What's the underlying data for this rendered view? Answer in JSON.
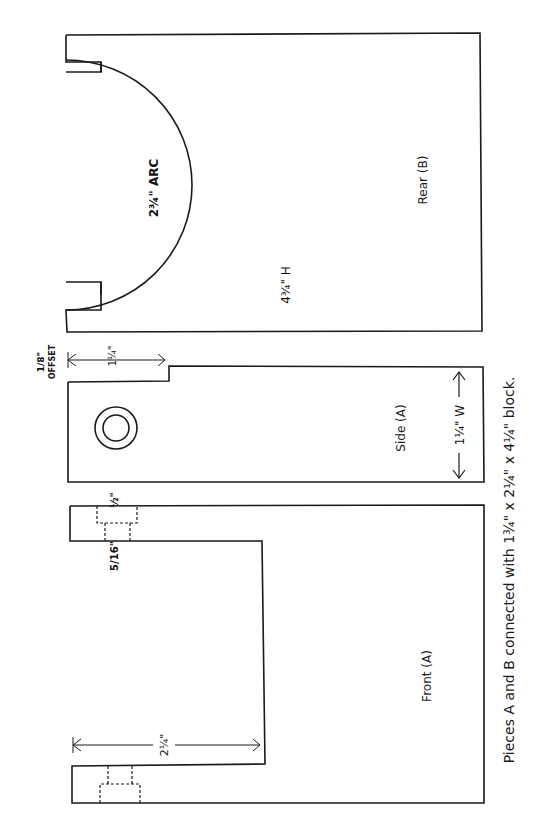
{
  "pieces": {
    "rear": {
      "label": "Rear (B)",
      "arc_label": "2¾\" ARC",
      "height_label": "4¾\" H"
    },
    "side": {
      "label": "Side (A)",
      "width_label": "1¼\" W",
      "step_label": "1¼\"",
      "offset_fraction": "1/8\"",
      "offset_word": "OFFSET"
    },
    "front": {
      "label": "Front (A)",
      "opening_label": "2¼\"",
      "hole_top_label": "½\"",
      "hole_bottom_label": "5/16\""
    }
  },
  "caption": "Pieces A and B connected with  1¾\" x 2¼\" x 4¼\"  block.",
  "colors": {
    "line": "#1a1a1a",
    "background": "#ffffff"
  }
}
